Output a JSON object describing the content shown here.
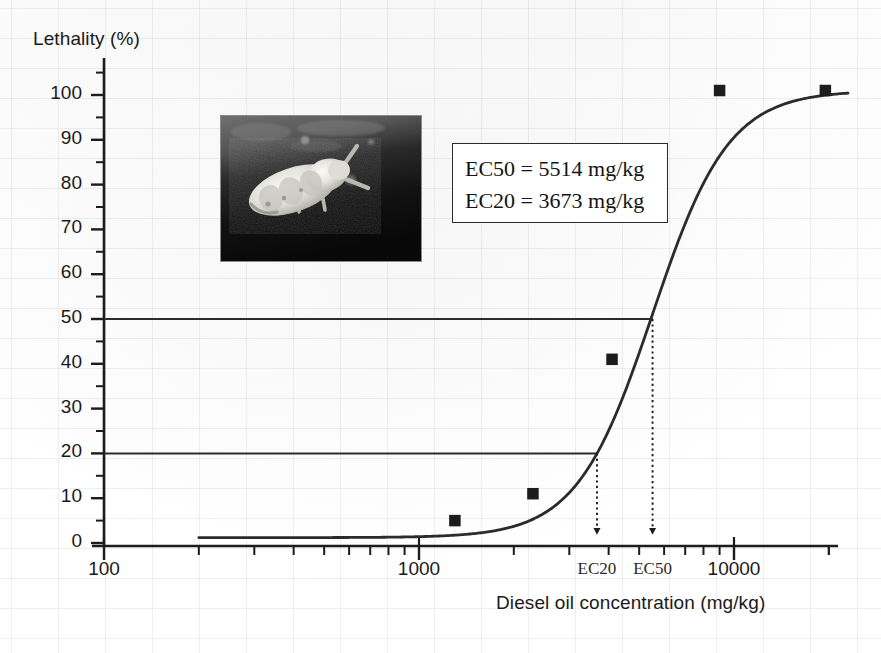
{
  "figure": {
    "ylabel": "Lethality (%)",
    "xlabel": "Diesel oil concentration (mg/kg)"
  },
  "annotation_box": {
    "line1": "EC50 = 5514 mg/kg",
    "line2": "EC20 = 3673 mg/kg"
  },
  "inset": {
    "name": "springtail-larva-photo",
    "alt": "grayscale micrograph of a pale springtail on dark soil"
  },
  "axis": {
    "y_ticks": [
      "0",
      "10",
      "20",
      "30",
      "40",
      "50",
      "60",
      "70",
      "80",
      "90",
      "100"
    ],
    "x_ticks": [
      "100",
      "1000",
      "10000"
    ],
    "ec_ticks": [
      "EC20",
      "EC50"
    ]
  },
  "chart_data": {
    "type": "line",
    "title": "",
    "xlabel": "Diesel oil concentration (mg/kg)",
    "ylabel": "Lethality (%)",
    "xscale": "log",
    "xlim": [
      100,
      23000
    ],
    "ylim": [
      0,
      107
    ],
    "grid": "faint-background-only",
    "legend": "none",
    "y_ticks": [
      0,
      10,
      20,
      30,
      40,
      50,
      60,
      70,
      80,
      90,
      100
    ],
    "y_minor_tick_step": 5,
    "x_ticks": [
      100,
      1000,
      10000
    ],
    "series": [
      {
        "name": "Observed lethality",
        "type": "scatter",
        "marker": "filled-square",
        "color": "#1c1c1c",
        "points": [
          {
            "x": 1300,
            "y": 5
          },
          {
            "x": 2300,
            "y": 11
          },
          {
            "x": 4100,
            "y": 41
          },
          {
            "x": 9000,
            "y": 101
          },
          {
            "x": 19500,
            "y": 101
          }
        ]
      },
      {
        "name": "Fitted logistic dose-response curve",
        "type": "line",
        "color": "#2b2b2b",
        "model": "logistic",
        "ec50": 5514,
        "slope": 3.6,
        "top": 101,
        "bottom": 1.2,
        "x_start": 200,
        "x_end": 23000
      }
    ],
    "reference_lines": [
      {
        "name": "EC50 level",
        "y": 50,
        "orientation": "horizontal",
        "color": "#2b2b2b"
      },
      {
        "name": "EC20 level",
        "y": 20,
        "orientation": "horizontal",
        "color": "#2b2b2b"
      }
    ],
    "annotations": [
      {
        "name": "EC50 drop arrow",
        "x": 5514,
        "from_y": 50,
        "to_y": 0,
        "style": "dotted-arrow",
        "label": "EC50"
      },
      {
        "name": "EC20 drop arrow",
        "x": 3673,
        "from_y": 20,
        "to_y": 0,
        "style": "dotted-arrow",
        "label": "EC20"
      },
      {
        "name": "EC box",
        "text": "EC50 = 5514 mg/kg; EC20 = 3673 mg/kg"
      }
    ],
    "ec50": 5514,
    "ec20": 3673,
    "units": "mg/kg"
  },
  "colors": {
    "ink": "#1c1c1c",
    "curve": "#2b2b2b",
    "grid": "#c9ccd4"
  }
}
